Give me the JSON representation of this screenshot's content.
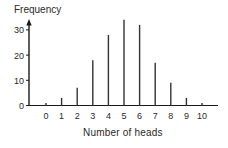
{
  "chart_data": {
    "type": "bar",
    "title": "",
    "xlabel": "Number of heads",
    "ylabel": "Frequency",
    "categories": [
      "0",
      "1",
      "2",
      "3",
      "4",
      "5",
      "6",
      "7",
      "8",
      "9",
      "10"
    ],
    "values": [
      1,
      3,
      7,
      18,
      28,
      34,
      32,
      17,
      9,
      3,
      1
    ],
    "yticks": [
      0,
      10,
      20,
      30
    ],
    "ylim": [
      0,
      34
    ],
    "grid": false,
    "legend": null,
    "style": "vertical line (spike) plot"
  },
  "colors": {
    "axis": "#1a1a1a",
    "bar": "#333333",
    "text": "#2a2a2a"
  }
}
